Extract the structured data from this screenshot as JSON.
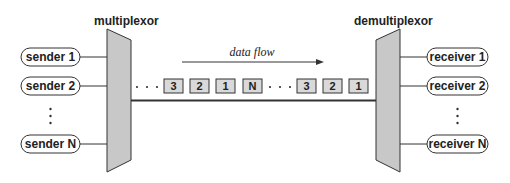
{
  "diagram": {
    "multiplexor_label": "multiplexor",
    "demultiplexor_label": "demultiplexor",
    "flow_label": "data flow",
    "senders": [
      "sender 1",
      "sender 2",
      "sender N"
    ],
    "receivers": [
      "receiver 1",
      "receiver 2",
      "receiver N"
    ],
    "ellipsis": "⋮",
    "packets_left": [
      "3",
      "2",
      "1",
      "N"
    ],
    "packets_right": [
      "3",
      "2",
      "1"
    ],
    "colors": {
      "mux_fill": "#c8c8c8",
      "packet_fill": "#d9d9d9",
      "stroke": "#333333"
    }
  }
}
